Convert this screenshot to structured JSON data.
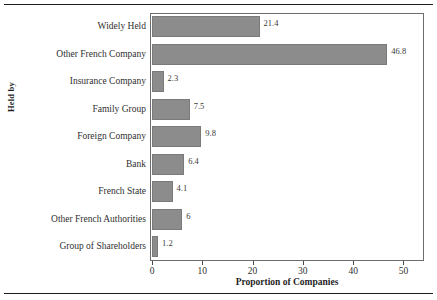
{
  "chart_data": {
    "type": "bar",
    "orientation": "horizontal",
    "title": "",
    "xlabel": "Proportion of Companies",
    "ylabel": "Held by",
    "xlim": [
      0,
      52.5
    ],
    "xticks": [
      0,
      10,
      20,
      30,
      40,
      50
    ],
    "xtick_labels": [
      "0",
      "10",
      "20",
      "30",
      "40",
      "50"
    ],
    "grid": false,
    "legend": false,
    "bar_color": "#8c8c8c",
    "bar_edge_color": "#7a7a7a",
    "frame_color": "#6d6d6d",
    "background": "#ffffff",
    "categories": [
      "Widely Held",
      "Other French Company",
      "Insurance Company",
      "Family Group",
      "Foreign Company",
      "Bank",
      "French State",
      "Other French Authorities",
      "Group of Shareholders"
    ],
    "values": [
      21.4,
      46.8,
      2.3,
      7.5,
      9.8,
      6.4,
      4.1,
      6,
      1.2
    ],
    "value_labels": [
      "21.4",
      "46.8",
      "2.3",
      "7.5",
      "9.8",
      "6.4",
      "4.1",
      "6",
      "1.2"
    ]
  }
}
